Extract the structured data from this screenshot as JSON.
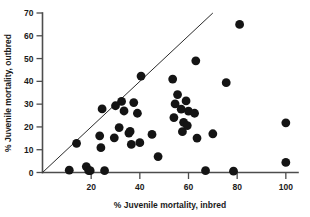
{
  "chart_data": {
    "type": "scatter",
    "title": "",
    "xlabel": "% Juvenile mortality, inbred",
    "ylabel": "% Juvenile mortality, outbred",
    "xlim": [
      0,
      105
    ],
    "ylim": [
      0,
      70
    ],
    "xticks": [
      20,
      40,
      60,
      80,
      100
    ],
    "xtick_labels": [
      "20",
      "40",
      "60",
      "80",
      "100"
    ],
    "yticks": [
      0,
      10,
      20,
      30,
      40,
      50,
      60,
      70
    ],
    "ytick_labels": [
      "0",
      "10",
      "20",
      "30",
      "40",
      "50",
      "60",
      "70"
    ],
    "grid": false,
    "legend": null,
    "annotations": [
      {
        "name": "unity-line",
        "type": "line",
        "description": "y = x reference line",
        "from": [
          0,
          0
        ],
        "to": [
          70,
          70
        ]
      }
    ],
    "marker": {
      "shape": "circle",
      "color": "#141414",
      "size": 4.4
    },
    "series": [
      {
        "name": "populations",
        "points": [
          [
            11.0,
            1.0
          ],
          [
            14.0,
            12.8
          ],
          [
            18.0,
            2.6
          ],
          [
            19.0,
            0.8
          ],
          [
            19.6,
            0.8
          ],
          [
            23.5,
            16.1
          ],
          [
            24.0,
            10.9
          ],
          [
            24.5,
            27.9
          ],
          [
            25.5,
            0.8
          ],
          [
            29.5,
            15.2
          ],
          [
            30.0,
            29.3
          ],
          [
            31.5,
            19.7
          ],
          [
            32.5,
            31.2
          ],
          [
            33.5,
            27.0
          ],
          [
            35.5,
            17.3
          ],
          [
            36.0,
            18.0
          ],
          [
            36.5,
            12.3
          ],
          [
            37.5,
            30.7
          ],
          [
            39.0,
            26.0
          ],
          [
            40.0,
            13.1
          ],
          [
            40.5,
            42.3
          ],
          [
            45.0,
            16.7
          ],
          [
            47.5,
            7.0
          ],
          [
            53.5,
            41.0
          ],
          [
            54.0,
            24.1
          ],
          [
            54.5,
            30.1
          ],
          [
            55.5,
            34.2
          ],
          [
            57.0,
            27.8
          ],
          [
            57.5,
            17.9
          ],
          [
            58.0,
            22.0
          ],
          [
            59.0,
            31.4
          ],
          [
            59.5,
            20.6
          ],
          [
            60.0,
            26.9
          ],
          [
            62.5,
            26.0
          ],
          [
            63.0,
            49.0
          ],
          [
            63.5,
            15.1
          ],
          [
            67.0,
            0.8
          ],
          [
            70.0,
            17.0
          ],
          [
            75.5,
            39.4
          ],
          [
            78.5,
            0.6
          ],
          [
            81.0,
            65.0
          ],
          [
            100.0,
            21.8
          ],
          [
            100.0,
            4.4
          ]
        ]
      }
    ]
  },
  "figure": {
    "background": "#ffffff",
    "axis_color": "#4d4d4d",
    "line_color": "#2b2b2b",
    "marker_color": "#141414"
  }
}
